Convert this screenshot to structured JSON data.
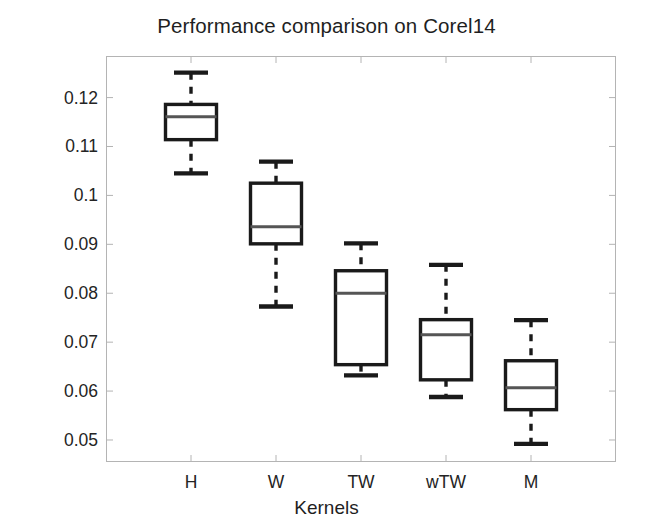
{
  "chart_data": {
    "type": "box",
    "title": "Performance comparison on Corel14",
    "xlabel": "Kernels",
    "ylabel": "Test error",
    "categories": [
      "H",
      "W",
      "TW",
      "wTW",
      "M"
    ],
    "ylim": [
      0.0455,
      0.1285
    ],
    "yticks": [
      0.05,
      0.06,
      0.07,
      0.08,
      0.09,
      0.1,
      0.11,
      0.12
    ],
    "ytick_labels": [
      "0.05",
      "0.06",
      "0.07",
      "0.08",
      "0.09",
      "0.1",
      "0.11",
      "0.12"
    ],
    "grid": false,
    "legend": null,
    "box_color": "#1a1a1a",
    "median_color": "#555555",
    "frame_color": "#b4b4b4",
    "background": "#ffffff",
    "boxes": [
      {
        "category": "H",
        "whisker_low": 0.1045,
        "q1": 0.1114,
        "median": 0.1161,
        "q3": 0.1186,
        "whisker_high": 0.1251
      },
      {
        "category": "W",
        "whisker_low": 0.0773,
        "q1": 0.0901,
        "median": 0.0936,
        "q3": 0.1025,
        "whisker_high": 0.1069
      },
      {
        "category": "TW",
        "whisker_low": 0.0632,
        "q1": 0.0654,
        "median": 0.08,
        "q3": 0.0846,
        "whisker_high": 0.0902
      },
      {
        "category": "wTW",
        "whisker_low": 0.0588,
        "q1": 0.0623,
        "median": 0.0715,
        "q3": 0.0746,
        "whisker_high": 0.0858
      },
      {
        "category": "M",
        "whisker_low": 0.0492,
        "q1": 0.0562,
        "median": 0.0607,
        "q3": 0.0662,
        "whisker_high": 0.0745
      }
    ]
  }
}
